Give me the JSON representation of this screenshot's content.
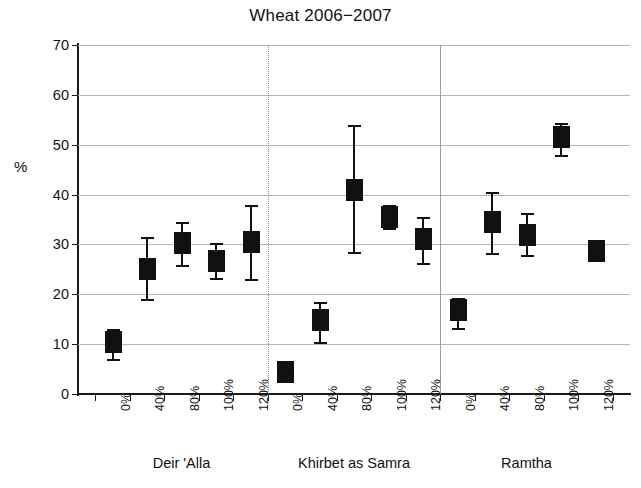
{
  "chart_data": {
    "type": "scatter",
    "title": "Wheat 2006−2007",
    "xlabel": "",
    "ylabel": "%",
    "ylim": [
      0,
      70
    ],
    "yticks": [
      0,
      10,
      20,
      30,
      40,
      50,
      60,
      70
    ],
    "grid": true,
    "legend": "none",
    "error_bars": "symmetric-whiskers",
    "marker": "filled-square-box",
    "groups": [
      {
        "name": "Deir 'Alla",
        "categories": [
          "0%",
          "40%",
          "80%",
          "100%",
          "120%"
        ],
        "values": [
          10.5,
          25.0,
          30.3,
          26.7,
          30.5
        ],
        "upper": [
          13.0,
          31.5,
          34.5,
          30.3,
          38.0
        ],
        "lower": [
          7.0,
          19.0,
          25.8,
          23.3,
          23.0
        ]
      },
      {
        "name": "Khirbet as Samra",
        "categories": [
          "0%",
          "40%",
          "80%",
          "100%",
          "120%"
        ],
        "values": [
          4.4,
          14.8,
          41.0,
          35.6,
          31.0
        ],
        "upper": [
          4.4,
          18.5,
          54.0,
          38.0,
          35.5
        ],
        "lower": [
          4.4,
          10.5,
          28.5,
          33.3,
          26.3
        ]
      },
      {
        "name": "Ramtha",
        "categories": [
          "0%",
          "40%",
          "80%",
          "100%",
          "120%"
        ],
        "values": [
          16.8,
          34.4,
          31.8,
          51.5,
          28.6
        ],
        "upper": [
          19.3,
          40.5,
          36.3,
          54.3,
          30.3
        ],
        "lower": [
          13.3,
          28.3,
          27.8,
          48.0,
          27.0
        ]
      }
    ]
  },
  "axis": {
    "y_title": "%",
    "y_tick_labels": [
      "0",
      "10",
      "20",
      "30",
      "40",
      "50",
      "60",
      "70"
    ]
  }
}
